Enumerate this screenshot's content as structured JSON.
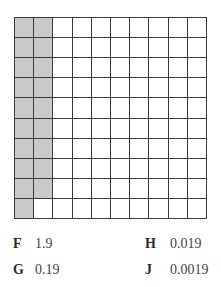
{
  "figure": {
    "type": "hundred-grid",
    "rows": 10,
    "columns": 10,
    "shaded_count": 19,
    "shaded_color": "#c9c9c9",
    "line_color": "#3a3a3a"
  },
  "options": [
    {
      "letter": "F",
      "value": "1.9"
    },
    {
      "letter": "G",
      "value": "0.19"
    },
    {
      "letter": "H",
      "value": "0.019"
    },
    {
      "letter": "J",
      "value": "0.0019"
    }
  ]
}
